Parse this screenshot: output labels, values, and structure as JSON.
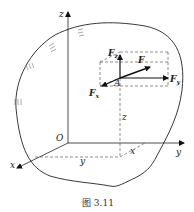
{
  "figure": {
    "caption": "图 3.11",
    "axes": {
      "x": "x",
      "y": "y",
      "z": "z",
      "origin": "O"
    },
    "point": "A",
    "forces": {
      "F": "F",
      "Fx": {
        "base": "F",
        "sub": "x"
      },
      "Fy": {
        "base": "F",
        "sub": "y"
      },
      "Fz": {
        "base": "F",
        "sub": "z"
      }
    },
    "coordinates": {
      "x": "x",
      "y": "y",
      "z": "z"
    }
  }
}
